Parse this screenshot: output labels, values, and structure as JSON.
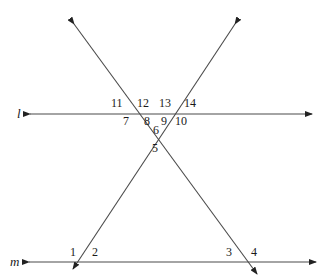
{
  "diagram": {
    "type": "geometry-lines-and-transversals",
    "lines": [
      {
        "id": "l",
        "label": "l",
        "kind": "horizontal"
      },
      {
        "id": "m",
        "label": "m",
        "kind": "horizontal"
      },
      {
        "id": "t1",
        "label": "",
        "kind": "transversal-descending"
      },
      {
        "id": "t2",
        "label": "",
        "kind": "transversal-ascending"
      }
    ],
    "angle_labels": {
      "a1": "1",
      "a2": "2",
      "a3": "3",
      "a4": "4",
      "a5": "5",
      "a6": "6",
      "a7": "7",
      "a8": "8",
      "a9": "9",
      "a10": "10",
      "a11": "11",
      "a12": "12",
      "a13": "13",
      "a14": "14"
    },
    "line_color": "#4a4a4a",
    "text_color": "#1a1a1a"
  }
}
